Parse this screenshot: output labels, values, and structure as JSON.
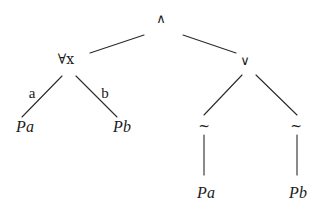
{
  "diagram": {
    "type": "semantic-tableau-tree",
    "line_color": "#2a2a2a",
    "nodes": {
      "root": {
        "label": "∧",
        "x": 161,
        "y": 18
      },
      "forall": {
        "label": "∀x",
        "x": 66,
        "y": 59
      },
      "or": {
        "label": "∨",
        "x": 245,
        "y": 60
      },
      "forall_pa": {
        "label": "Pa",
        "x": 25,
        "y": 127
      },
      "forall_pb": {
        "label": "Pb",
        "x": 122,
        "y": 127
      },
      "neg_left": {
        "label": "~",
        "x": 204,
        "y": 126
      },
      "neg_right": {
        "label": "~",
        "x": 296,
        "y": 126
      },
      "neg_pa": {
        "label": "Pa",
        "x": 206,
        "y": 193
      },
      "neg_pb": {
        "label": "Pb",
        "x": 298,
        "y": 193
      }
    },
    "edge_labels": {
      "a": {
        "label": "a",
        "x": 32,
        "y": 93
      },
      "b": {
        "label": "b",
        "x": 105,
        "y": 93
      }
    },
    "edges": [
      {
        "from": "root",
        "to": "forall",
        "x1": 144,
        "y1": 35,
        "x2": 90,
        "y2": 53
      },
      {
        "from": "root",
        "to": "or",
        "x1": 183,
        "y1": 35,
        "x2": 236,
        "y2": 53
      },
      {
        "from": "forall",
        "to": "forall_pa",
        "x1": 62,
        "y1": 76,
        "x2": 22,
        "y2": 117,
        "label": "a"
      },
      {
        "from": "forall",
        "to": "forall_pb",
        "x1": 76,
        "y1": 76,
        "x2": 117,
        "y2": 117,
        "label": "b"
      },
      {
        "from": "or",
        "to": "neg_left",
        "x1": 242,
        "y1": 75,
        "x2": 204,
        "y2": 115
      },
      {
        "from": "or",
        "to": "neg_right",
        "x1": 256,
        "y1": 75,
        "x2": 297,
        "y2": 115
      },
      {
        "from": "neg_left",
        "to": "neg_pa",
        "x1": 204,
        "y1": 135,
        "x2": 204,
        "y2": 175
      },
      {
        "from": "neg_right",
        "to": "neg_pb",
        "x1": 297,
        "y1": 135,
        "x2": 297,
        "y2": 175
      }
    ]
  }
}
